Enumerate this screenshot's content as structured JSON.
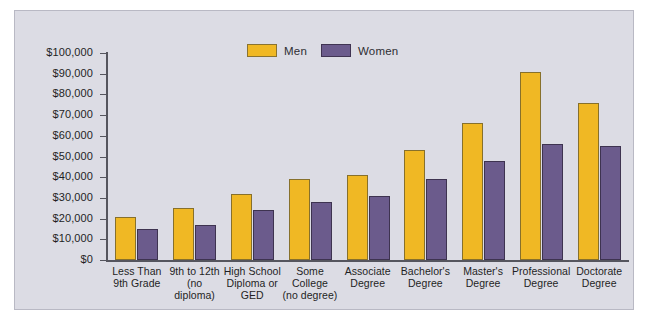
{
  "chart_data": {
    "type": "bar",
    "title": "",
    "xlabel": "",
    "ylabel": "",
    "ylim": [
      0,
      100000
    ],
    "grid": false,
    "legend_position": "top-center",
    "y_ticks": [
      "$100,000",
      "$90,000",
      "$80,000",
      "$70,000",
      "$60,000",
      "$50,000",
      "$40,000",
      "$30,000",
      "$20,000",
      "$10,000",
      "$0"
    ],
    "y_tick_values": [
      100000,
      90000,
      80000,
      70000,
      60000,
      50000,
      40000,
      30000,
      20000,
      10000,
      0
    ],
    "categories": [
      "Less Than\n9th Grade",
      "9th to 12th\n(no diploma)",
      "High School\nDiploma or\nGED",
      "Some\nCollege\n(no degree)",
      "Associate\nDegree",
      "Bachelor's\nDegree",
      "Master's\nDegree",
      "Professional\nDegree",
      "Doctorate\nDegree"
    ],
    "series": [
      {
        "name": "Men",
        "color": "#f0b824",
        "values": [
          21000,
          25000,
          32000,
          39000,
          41000,
          53000,
          66000,
          91000,
          76000
        ]
      },
      {
        "name": "Women",
        "color": "#6b5b8c",
        "values": [
          15000,
          17000,
          24000,
          28000,
          31000,
          39000,
          48000,
          56000,
          55000
        ]
      }
    ]
  },
  "legend": {
    "entries": [
      {
        "label": "Men"
      },
      {
        "label": "Women"
      }
    ]
  },
  "colors": {
    "men": "#f0b824",
    "women": "#6b5b8c",
    "plot_background": "#dcdce4",
    "axis": "#55555e",
    "page_background": "#ffffff"
  }
}
